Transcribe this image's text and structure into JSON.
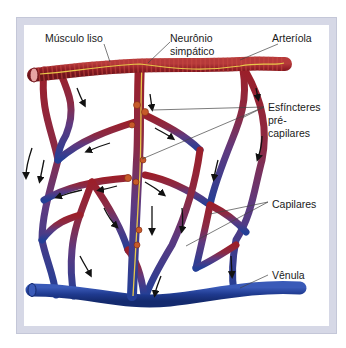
{
  "figure": {
    "labels": {
      "musculo_liso": "Músculo liso",
      "neuronio_line1": "Neurônio",
      "neuronio_line2": "simpático",
      "arteriola": "Arteríola",
      "esfincteres_line1": "Esfíncteres",
      "esfincteres_line2": "pré-",
      "esfincteres_line3": "capilares",
      "capilares": "Capilares",
      "venula": "Vênula"
    },
    "colors": {
      "arterial": "#9b1f2a",
      "venous": "#1f3a8f",
      "capillary_mid": "#6b3a7a",
      "nerve": "#e8c84a",
      "frame": "#d6d8e6"
    }
  }
}
